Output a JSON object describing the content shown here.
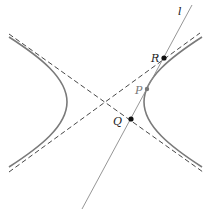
{
  "diagram": {
    "type": "hyperbola-tangent",
    "labels": {
      "line": "l",
      "R": "R",
      "P": "P",
      "Q": "Q"
    },
    "colors": {
      "curve": "#7a7a7a",
      "asymptote": "#333333",
      "line": "#8a8a8a",
      "point": "#111111",
      "tangent_point": "#777777"
    }
  }
}
